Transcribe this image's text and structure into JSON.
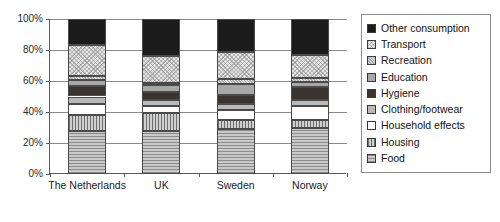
{
  "chart_data": {
    "type": "bar",
    "subtype": "stacked-percent",
    "title": "",
    "xlabel": "",
    "ylabel": "",
    "ylim": [
      0,
      100
    ],
    "ytick_labels": [
      "0%",
      "20%",
      "40%",
      "60%",
      "80%",
      "100%"
    ],
    "ytick_values": [
      0,
      20,
      40,
      60,
      80,
      100
    ],
    "grid": true,
    "legend_position": "right",
    "categories": [
      "The Netherlands",
      "UK",
      "Sweden",
      "Norway"
    ],
    "stack_order_bottom_to_top": [
      "Food",
      "Housing",
      "Household effects",
      "Clothing/footwear",
      "Hygiene",
      "Education",
      "Recreation",
      "Transport",
      "Other consumption"
    ],
    "series": [
      {
        "name": "Food",
        "pattern": "horizontal-lines",
        "values": [
          28.0,
          28.0,
          29.0,
          30.0
        ]
      },
      {
        "name": "Housing",
        "pattern": "vertical-lines",
        "values": [
          10.0,
          11.5,
          6.0,
          5.0
        ]
      },
      {
        "name": "Household effects",
        "pattern": "solid-white",
        "values": [
          7.0,
          4.5,
          6.0,
          9.0
        ]
      },
      {
        "name": "Clothing/footwear",
        "pattern": "solid-light-gray",
        "values": [
          5.0,
          4.0,
          4.0,
          4.0
        ]
      },
      {
        "name": "Hygiene",
        "pattern": "solid-dark",
        "values": [
          6.5,
          5.0,
          6.0,
          8.0
        ]
      },
      {
        "name": "Education",
        "pattern": "solid-mid-gray",
        "values": [
          4.0,
          4.5,
          7.0,
          3.5
        ]
      },
      {
        "name": "Recreation",
        "pattern": "fine-hatch",
        "values": [
          2.5,
          1.5,
          3.0,
          2.5
        ]
      },
      {
        "name": "Transport",
        "pattern": "cross-hatch",
        "values": [
          20.5,
          17.0,
          18.0,
          14.5
        ]
      },
      {
        "name": "Other consumption",
        "pattern": "solid-black",
        "values": [
          16.5,
          24.0,
          21.0,
          23.5
        ]
      }
    ]
  },
  "legend": {
    "items": [
      {
        "label": "Other consumption",
        "pattern": "solid-black"
      },
      {
        "label": "Transport",
        "pattern": "cross-hatch"
      },
      {
        "label": "Recreation",
        "pattern": "fine-hatch"
      },
      {
        "label": "Education",
        "pattern": "solid-mid-gray"
      },
      {
        "label": "Hygiene",
        "pattern": "solid-dark"
      },
      {
        "label": "Clothing/footwear",
        "pattern": "solid-light-gray"
      },
      {
        "label": "Household effects",
        "pattern": "solid-white"
      },
      {
        "label": "Housing",
        "pattern": "vertical-lines"
      },
      {
        "label": "Food",
        "pattern": "horizontal-lines"
      }
    ]
  },
  "colors": {
    "axis": "#5a5a5a",
    "grid": "#8a8a8a",
    "segment_border": "#4a4a4a",
    "text": "#1a1a1a",
    "background": "#ffffff"
  }
}
